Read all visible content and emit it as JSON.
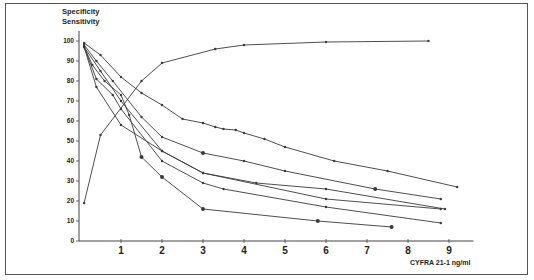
{
  "chart_data": {
    "type": "line",
    "title": "",
    "ylabel_lines": [
      "Specificity",
      "Sensitivity"
    ],
    "xlabel": "CYFRA 21-1 ng/ml",
    "ylim": [
      0,
      100
    ],
    "xlim": [
      0,
      9.5
    ],
    "yticks": [
      0,
      10,
      20,
      30,
      40,
      50,
      60,
      70,
      80,
      90,
      100
    ],
    "xticks": [
      1,
      2,
      3,
      4,
      5,
      6,
      7,
      8,
      9
    ],
    "grid": false,
    "legend": "none",
    "series": [
      {
        "name": "Sensitivity",
        "points": [
          [
            0.1,
            19
          ],
          [
            0.5,
            53
          ],
          [
            1.5,
            80
          ],
          [
            2,
            89
          ],
          [
            3.3,
            96
          ],
          [
            4,
            98
          ],
          [
            6,
            99.5
          ],
          [
            8.5,
            100
          ]
        ]
      },
      {
        "name": "Specificity A",
        "points": [
          [
            0.1,
            99
          ],
          [
            0.5,
            93
          ],
          [
            1,
            82
          ],
          [
            1.5,
            74
          ],
          [
            2,
            68
          ],
          [
            2.5,
            61
          ],
          [
            3,
            59
          ],
          [
            3.3,
            57
          ],
          [
            3.5,
            56
          ],
          [
            3.8,
            55.5
          ],
          [
            4,
            54
          ],
          [
            4.5,
            51
          ],
          [
            5,
            47
          ],
          [
            6.2,
            40
          ],
          [
            7.5,
            35
          ],
          [
            9.2,
            27
          ]
        ]
      },
      {
        "name": "Specificity B",
        "points": [
          [
            0.1,
            98
          ],
          [
            0.4,
            90
          ],
          [
            0.8,
            80
          ],
          [
            1.5,
            62
          ],
          [
            2,
            52
          ],
          [
            3,
            44
          ],
          [
            4,
            40
          ],
          [
            5,
            35
          ],
          [
            7.2,
            26
          ],
          [
            8.8,
            21
          ]
        ]
      },
      {
        "name": "Specificity C",
        "points": [
          [
            0.1,
            97
          ],
          [
            0.5,
            85
          ],
          [
            1,
            70
          ],
          [
            2,
            45
          ],
          [
            3,
            34
          ],
          [
            4.3,
            29
          ],
          [
            6,
            26
          ],
          [
            8.9,
            16
          ]
        ]
      },
      {
        "name": "Specificity D",
        "points": [
          [
            0.1,
            97
          ],
          [
            0.4,
            81
          ],
          [
            0.8,
            73
          ],
          [
            1,
            66
          ],
          [
            2,
            40
          ],
          [
            3,
            29
          ],
          [
            3.5,
            26
          ],
          [
            6,
            17
          ],
          [
            8.8,
            9
          ]
        ]
      },
      {
        "name": "Specificity E",
        "points": [
          [
            0.1,
            97
          ],
          [
            0.4,
            77
          ],
          [
            1,
            58
          ],
          [
            2,
            45
          ],
          [
            3,
            34
          ],
          [
            6,
            21
          ],
          [
            8.8,
            16
          ]
        ]
      },
      {
        "name": "Specificity F",
        "points": [
          [
            0.1,
            97
          ],
          [
            0.3,
            88
          ],
          [
            0.6,
            80
          ],
          [
            1,
            73
          ],
          [
            1.2,
            63
          ],
          [
            1.5,
            42
          ],
          [
            2,
            32
          ],
          [
            3,
            16
          ],
          [
            5.8,
            10
          ],
          [
            7.6,
            7
          ]
        ]
      }
    ]
  },
  "axes": {
    "ylabel_line1": "Specificity",
    "ylabel_line2": "Sensitivity",
    "xlabel": "CYFRA 21-1 ng/ml",
    "yticks": [
      "0",
      "10",
      "20",
      "30",
      "40",
      "50",
      "60",
      "70",
      "80",
      "90",
      "100"
    ],
    "xticks": [
      "1",
      "2",
      "3",
      "4",
      "5",
      "6",
      "7",
      "8",
      "9"
    ]
  },
  "colors": {
    "line": "#3a3a3a",
    "axis": "#444444",
    "frame": "#555555"
  }
}
